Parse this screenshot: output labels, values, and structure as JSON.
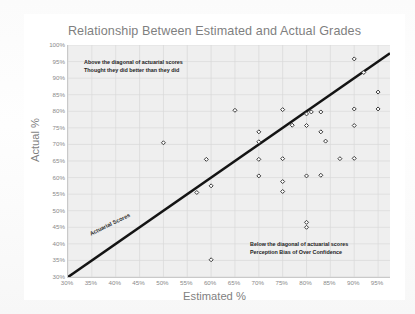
{
  "chart_data": {
    "type": "scatter",
    "title": "Relationship Between Estimated and Actual Grades",
    "xlabel": "Estimated %",
    "ylabel": "Actual %",
    "xlim": [
      30,
      97.5
    ],
    "ylim": [
      30,
      100
    ],
    "grid": true,
    "legend": "none",
    "xticks": [
      "30%",
      "35%",
      "40%",
      "45%",
      "50%",
      "55%",
      "60%",
      "65%",
      "70%",
      "75%",
      "80%",
      "85%",
      "90%",
      "95%"
    ],
    "xtick_values": [
      30,
      35,
      40,
      45,
      50,
      55,
      60,
      65,
      70,
      75,
      80,
      85,
      90,
      95
    ],
    "yticks": [
      "30%",
      "35%",
      "40%",
      "45%",
      "50%",
      "55%",
      "60%",
      "65%",
      "70%",
      "75%",
      "80%",
      "85%",
      "90%",
      "95%",
      "100%"
    ],
    "ytick_values": [
      30,
      35,
      40,
      45,
      50,
      55,
      60,
      65,
      70,
      75,
      80,
      85,
      90,
      95,
      100
    ],
    "reference_line": {
      "label": "Actuarial Scores",
      "type": "diagonal",
      "from": [
        30,
        30
      ],
      "to": [
        97.5,
        97.5
      ],
      "color": "#1a1a1a"
    },
    "points": [
      {
        "x": 50,
        "y": 70.5
      },
      {
        "x": 57,
        "y": 55.5
      },
      {
        "x": 59,
        "y": 65.5
      },
      {
        "x": 60,
        "y": 57.5
      },
      {
        "x": 60,
        "y": 35.2
      },
      {
        "x": 65,
        "y": 80.3
      },
      {
        "x": 70,
        "y": 73.8
      },
      {
        "x": 70,
        "y": 70.8
      },
      {
        "x": 70,
        "y": 65.5
      },
      {
        "x": 70,
        "y": 60.5
      },
      {
        "x": 75,
        "y": 80.5
      },
      {
        "x": 75,
        "y": 65.7
      },
      {
        "x": 75,
        "y": 58.8
      },
      {
        "x": 75,
        "y": 55.8
      },
      {
        "x": 77,
        "y": 75.8
      },
      {
        "x": 80,
        "y": 79.2
      },
      {
        "x": 80,
        "y": 75.7
      },
      {
        "x": 80,
        "y": 60.5
      },
      {
        "x": 80,
        "y": 46.5
      },
      {
        "x": 80,
        "y": 45.0
      },
      {
        "x": 81,
        "y": 79.8
      },
      {
        "x": 83,
        "y": 79.8
      },
      {
        "x": 83,
        "y": 73.8
      },
      {
        "x": 83,
        "y": 60.7
      },
      {
        "x": 84,
        "y": 71.0
      },
      {
        "x": 87,
        "y": 65.7
      },
      {
        "x": 90,
        "y": 95.8
      },
      {
        "x": 90,
        "y": 80.7
      },
      {
        "x": 90,
        "y": 75.7
      },
      {
        "x": 90,
        "y": 65.8
      },
      {
        "x": 92,
        "y": 91.7
      },
      {
        "x": 95,
        "y": 85.8
      },
      {
        "x": 95,
        "y": 80.7
      }
    ],
    "annotations": [
      {
        "name": "above-diagonal-note",
        "line1": "Above the diagonal of actuarial scores",
        "line2": "Thought they did better than they did"
      },
      {
        "name": "below-diagonal-note",
        "line1": "Below the diagonal of actuarial scores",
        "line2": "Perception Bias of Over Confidence"
      }
    ],
    "colors": {
      "plot_background": "#efefef",
      "gridline": "#d9d9d9",
      "marker_edge": "#3a3a3a",
      "reference_line": "#141414",
      "title_text": "#7f7f7f",
      "tick_text": "#8a8a8a",
      "annotation_text": "#232323"
    }
  }
}
